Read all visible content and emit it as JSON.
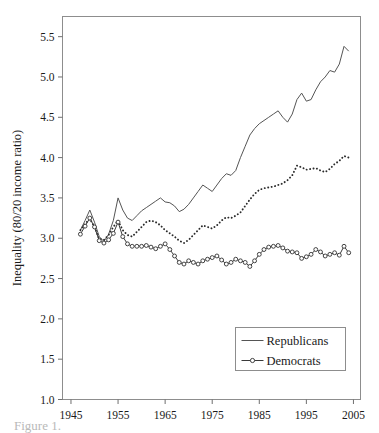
{
  "chart_data": {
    "type": "line",
    "title": "",
    "xlabel": "",
    "ylabel": "Inequality (80/20 income ratio)",
    "xlim": [
      1943.2,
      2006.5
    ],
    "ylim": [
      1.0,
      5.75
    ],
    "xticks": [
      1945,
      1955,
      1965,
      1975,
      1985,
      1995,
      2005
    ],
    "xtick_labels": [
      "1945",
      "1955",
      "1965",
      "1975",
      "1985",
      "1995",
      "2005"
    ],
    "yticks": [
      1.0,
      1.5,
      2.0,
      2.5,
      3.0,
      3.5,
      4.0,
      4.5,
      5.0,
      5.5
    ],
    "ytick_labels": [
      "1.0",
      "1.5",
      "2.0",
      "2.5",
      "3.0",
      "3.5",
      "4.0",
      "4.5",
      "5.0",
      "5.5"
    ],
    "grid": false,
    "frame": true,
    "legend_position": "lower-right",
    "legend_entries": [
      "Republicans",
      "Democrats"
    ],
    "x": [
      1947,
      1948,
      1949,
      1950,
      1951,
      1952,
      1953,
      1954,
      1955,
      1956,
      1957,
      1958,
      1959,
      1960,
      1961,
      1962,
      1963,
      1964,
      1965,
      1966,
      1967,
      1968,
      1969,
      1970,
      1971,
      1972,
      1973,
      1974,
      1975,
      1976,
      1977,
      1978,
      1979,
      1980,
      1981,
      1982,
      1983,
      1984,
      1985,
      1986,
      1987,
      1988,
      1989,
      1990,
      1991,
      1992,
      1993,
      1994,
      1995,
      1996,
      1997,
      1998,
      1999,
      2000,
      2001,
      2002,
      2003,
      2004
    ],
    "series": [
      {
        "name": "Republicans",
        "style": "solid-line",
        "color": "#555555",
        "marker": "none",
        "values": [
          3.1,
          3.22,
          3.35,
          3.2,
          3.02,
          2.96,
          3.05,
          3.22,
          3.5,
          3.35,
          3.25,
          3.22,
          3.28,
          3.34,
          3.38,
          3.42,
          3.46,
          3.5,
          3.45,
          3.44,
          3.4,
          3.33,
          3.36,
          3.42,
          3.5,
          3.58,
          3.66,
          3.62,
          3.58,
          3.66,
          3.74,
          3.8,
          3.78,
          3.84,
          4.0,
          4.14,
          4.28,
          4.36,
          4.42,
          4.46,
          4.5,
          4.54,
          4.58,
          4.5,
          4.44,
          4.54,
          4.72,
          4.8,
          4.7,
          4.72,
          4.84,
          4.94,
          5.0,
          5.08,
          5.06,
          5.16,
          5.38,
          5.32
        ]
      },
      {
        "name": "Third series (dotted)",
        "style": "dotted-line",
        "color": "#2b2b2b",
        "marker": "dot",
        "values": [
          3.1,
          3.18,
          3.24,
          3.14,
          2.99,
          2.98,
          3.04,
          3.14,
          3.22,
          3.1,
          3.04,
          3.02,
          3.08,
          3.14,
          3.2,
          3.22,
          3.2,
          3.16,
          3.1,
          3.06,
          3.02,
          2.97,
          2.94,
          2.98,
          3.04,
          3.1,
          3.16,
          3.14,
          3.12,
          3.16,
          3.22,
          3.26,
          3.25,
          3.28,
          3.32,
          3.4,
          3.48,
          3.55,
          3.6,
          3.62,
          3.63,
          3.64,
          3.66,
          3.68,
          3.72,
          3.78,
          3.9,
          3.88,
          3.85,
          3.86,
          3.87,
          3.84,
          3.82,
          3.86,
          3.92,
          3.96,
          4.02,
          4.0
        ]
      },
      {
        "name": "Democrats",
        "style": "line-with-open-circles",
        "color": "#3a3a3a",
        "marker": "open-circle",
        "values": [
          3.05,
          3.15,
          3.25,
          3.14,
          2.97,
          2.94,
          2.98,
          3.06,
          3.2,
          3.02,
          2.93,
          2.9,
          2.9,
          2.9,
          2.91,
          2.89,
          2.87,
          2.9,
          2.93,
          2.86,
          2.78,
          2.7,
          2.68,
          2.72,
          2.7,
          2.68,
          2.72,
          2.74,
          2.76,
          2.78,
          2.73,
          2.68,
          2.7,
          2.74,
          2.72,
          2.7,
          2.65,
          2.72,
          2.8,
          2.86,
          2.89,
          2.9,
          2.91,
          2.88,
          2.84,
          2.83,
          2.82,
          2.75,
          2.77,
          2.8,
          2.86,
          2.83,
          2.78,
          2.8,
          2.82,
          2.79,
          2.9,
          2.82
        ]
      }
    ]
  },
  "figure": {
    "caption_partial": "Figure 1."
  }
}
